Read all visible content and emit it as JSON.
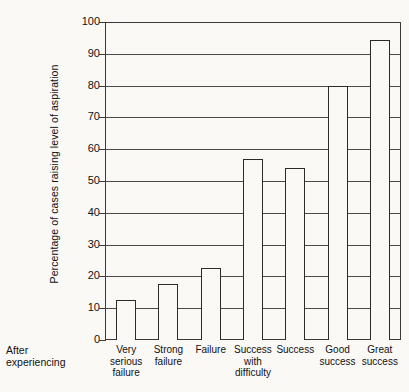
{
  "chart_data": {
    "type": "bar",
    "title": "",
    "xlabel": "",
    "ylabel": "Percentage of cases raising level of aspiration",
    "categories": [
      "Very serious failure",
      "Strong failure",
      "Failure",
      "Success with difficulty",
      "Success",
      "Good success",
      "Great success"
    ],
    "category_lines": [
      [
        "Very",
        "serious",
        "failure"
      ],
      [
        "Strong",
        "failure"
      ],
      [
        "Failure"
      ],
      [
        "Success",
        "with",
        "difficulty"
      ],
      [
        "Success"
      ],
      [
        "Good",
        "success"
      ],
      [
        "Great",
        "success"
      ]
    ],
    "values": [
      12.5,
      17.5,
      22.5,
      57,
      54,
      80,
      94.5
    ],
    "ylim": [
      0,
      100
    ],
    "yticks": [
      0,
      10,
      20,
      30,
      40,
      50,
      60,
      70,
      80,
      90,
      100
    ],
    "ytick_labels": [
      "0",
      "10",
      "20",
      "30",
      "40",
      "50",
      "60",
      "70",
      "80",
      "90",
      "100"
    ],
    "grid": true,
    "legend": "none",
    "bar_color": "#faf9f6",
    "bar_edge_color": "#2b2b2b",
    "axis_color": "#3a3a3a",
    "grid_color": "#4a4a4a"
  },
  "annotations": {
    "after_experiencing_lines": [
      "After",
      "experiencing"
    ]
  }
}
